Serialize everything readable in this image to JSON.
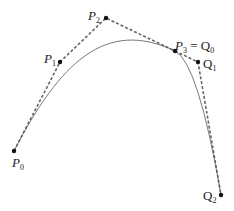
{
  "diagram": {
    "type": "composite-bezier-curve",
    "colors": {
      "control_polygon": "#666666",
      "curve": "#555555",
      "points": "#111111",
      "text": "#222222"
    },
    "points": [
      {
        "id": "P0",
        "letter": "P",
        "sub": "0",
        "x": 14,
        "y": 151
      },
      {
        "id": "P1",
        "letter": "P",
        "sub": "1",
        "x": 60,
        "y": 62
      },
      {
        "id": "P2",
        "letter": "P",
        "sub": "2",
        "x": 106,
        "y": 18
      },
      {
        "id": "P3",
        "letter": "P",
        "sub": "3",
        "x": 175,
        "y": 51
      },
      {
        "id": "Q1",
        "letter": "Q",
        "sub": "1",
        "x": 198,
        "y": 62
      },
      {
        "id": "Q2",
        "letter": "Q",
        "sub": "2",
        "x": 221,
        "y": 195
      }
    ],
    "labels": {
      "p0": {
        "letter": "P",
        "sub": "0"
      },
      "p1": {
        "letter": "P",
        "sub": "1"
      },
      "p2": {
        "letter": "P",
        "sub": "2"
      },
      "p3": {
        "letter": "P",
        "sub": "3",
        "eq": " = ",
        "letter2": "Q",
        "sub2": "0"
      },
      "q1": {
        "letter": "Q",
        "sub": "1"
      },
      "q2": {
        "letter": "Q",
        "sub": "2"
      }
    }
  }
}
